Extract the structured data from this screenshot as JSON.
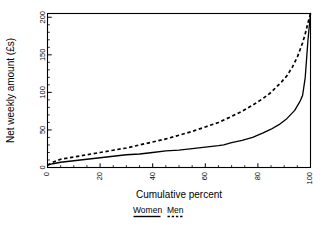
{
  "chart_data": {
    "type": "line",
    "title": "",
    "xlabel": "Cumulative percent",
    "ylabel": "Net weekly amount (£s)",
    "xlim": [
      0,
      100
    ],
    "ylim": [
      0,
      205
    ],
    "grid": false,
    "legend_position": "below-axis",
    "x_ticks": [
      0,
      20,
      40,
      60,
      80,
      100
    ],
    "x_tick_labels": [
      "0",
      "20",
      "40",
      "60",
      "80",
      "100"
    ],
    "x_minor_step": 5,
    "y_ticks": [
      0,
      50,
      100,
      150,
      200
    ],
    "y_tick_labels": [
      "0",
      "50",
      "100",
      "150",
      "200"
    ],
    "y_minor_step": 10,
    "series": [
      {
        "name": "Women",
        "style": "solid",
        "color": "#000000",
        "x": [
          0,
          2,
          5,
          10,
          15,
          20,
          25,
          30,
          35,
          40,
          45,
          50,
          55,
          60,
          65,
          67,
          70,
          74,
          78,
          82,
          85,
          88,
          91,
          94,
          96,
          97,
          98,
          99,
          100
        ],
        "y": [
          3,
          5,
          7,
          9,
          11,
          13,
          15,
          17,
          18,
          20,
          22,
          23,
          25,
          27,
          29,
          30,
          33,
          36,
          40,
          46,
          51,
          57,
          65,
          76,
          88,
          96,
          120,
          168,
          205
        ]
      },
      {
        "name": "Men",
        "style": "dashed",
        "color": "#000000",
        "x": [
          0,
          2,
          5,
          10,
          15,
          20,
          25,
          30,
          35,
          40,
          45,
          50,
          55,
          60,
          65,
          70,
          74,
          78,
          82,
          85,
          87,
          89,
          91,
          93,
          95,
          97,
          98,
          99,
          100
        ],
        "y": [
          3,
          7,
          11,
          14,
          17,
          20,
          23,
          26,
          30,
          34,
          38,
          43,
          48,
          54,
          60,
          68,
          75,
          83,
          92,
          100,
          107,
          114,
          122,
          133,
          147,
          166,
          178,
          192,
          205
        ]
      }
    ]
  },
  "legend": {
    "entries": [
      {
        "label": "Women",
        "style": "solid"
      },
      {
        "label": "Men",
        "style": "dashed"
      }
    ]
  },
  "axes": {
    "x_title": "Cumulative percent",
    "y_title": "Net weekly amount (£s)"
  }
}
